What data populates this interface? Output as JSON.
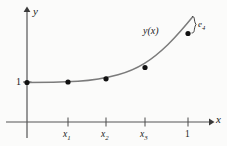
{
  "figure": {
    "background_color": "#fbfbfa",
    "ink_color": "#1a1a1a",
    "curve_color": "#7a7a7a",
    "axis_color": "#555555",
    "axis_labels": {
      "x": "x",
      "y": "y"
    },
    "y_axis_tick_label": "1",
    "curve_label": "y(x)",
    "error_label_base": "e",
    "error_label_sub": "4"
  },
  "chart_data": {
    "type": "line",
    "title": "",
    "subtitle": "",
    "xlabel": "x",
    "ylabel": "y",
    "xlim": [
      0,
      1.18
    ],
    "ylim": [
      0,
      3.4
    ],
    "grid": false,
    "legend": null,
    "annotations": [
      {
        "name": "curve-label",
        "text": "y(x)",
        "x": 0.73,
        "y": 2.35
      },
      {
        "name": "error-brace-label",
        "text": "e4",
        "x": 1.07,
        "y": 2.95
      }
    ],
    "xticks": [
      {
        "value": 0.25,
        "label": "x1"
      },
      {
        "value": 0.48,
        "label": "x2"
      },
      {
        "value": 0.73,
        "label": "x3"
      },
      {
        "value": 1.0,
        "label": "1"
      }
    ],
    "yticks": [
      {
        "value": 1.0,
        "label": "1"
      }
    ],
    "series": [
      {
        "name": "y(x)",
        "type": "line",
        "x": [
          0.0,
          0.25,
          0.48,
          0.73,
          1.02
        ],
        "y": [
          1.0,
          1.0,
          1.07,
          1.33,
          2.63
        ]
      },
      {
        "name": "numerical-points",
        "type": "scatter",
        "x": [
          0.0,
          0.25,
          0.48,
          0.73,
          1.0
        ],
        "y": [
          1.0,
          1.0,
          1.07,
          1.33,
          2.28
        ]
      }
    ]
  }
}
